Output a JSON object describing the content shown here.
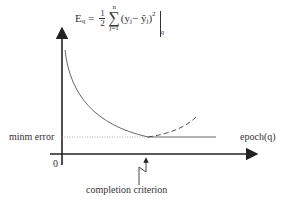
{
  "formula": {
    "lhs": "E",
    "lhs_sub": "q",
    "equals": "=",
    "frac_num": "1",
    "frac_den": "2",
    "sum_upper": "n",
    "sum_symbol": "∑",
    "sum_lower": "j=1",
    "term": "(y",
    "term_sub1": "j",
    "minus": " − ŷ",
    "term_sub2": "j",
    "close": ")",
    "power": "2",
    "eval_sub": "q"
  },
  "labels": {
    "y_level": "minm error",
    "x_axis": "epoch(q)",
    "origin": "0",
    "annotation": "completion criterion"
  },
  "colors": {
    "axis": "#222222",
    "curve": "#555555",
    "dotted": "#999999"
  }
}
